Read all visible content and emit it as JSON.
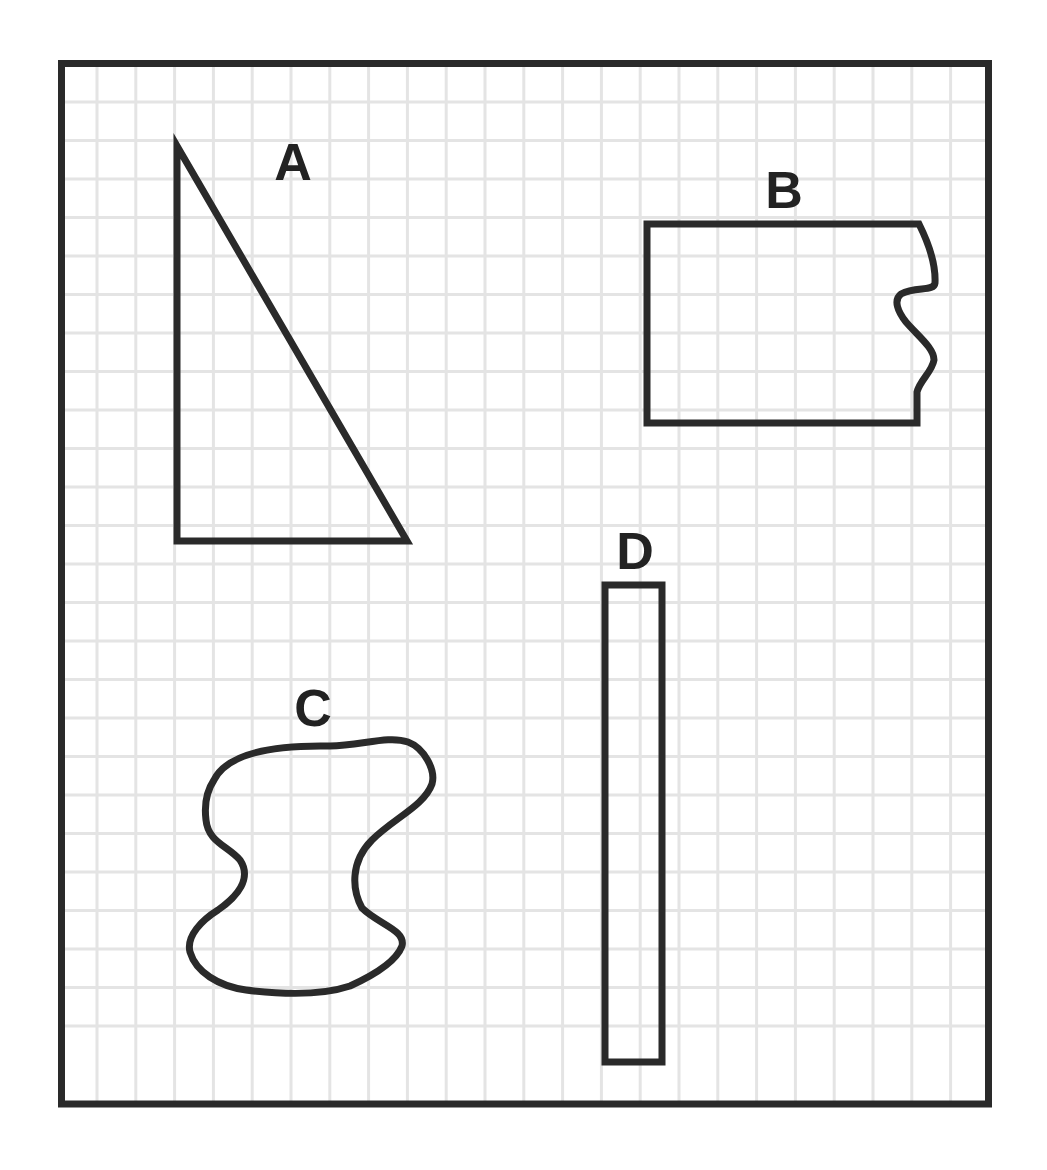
{
  "diagram": {
    "title": "",
    "frame": {
      "x": 61.5,
      "y": 63.5,
      "width": 927,
      "height": 1040.5,
      "stroke": "#2a2a2a",
      "stroke_width": 7
    },
    "grid": {
      "color": "#e4e4e4",
      "line_width": 3,
      "vertical_start": 97,
      "vertical_step": 38.8,
      "vertical_count": 23,
      "horizontal_start": 102,
      "horizontal_step": 38.5,
      "horizontal_count": 25
    },
    "shape_stroke": "#2a2a2a",
    "shape_stroke_width": 7,
    "shapes": [
      {
        "id": "A",
        "label": "A",
        "type": "right-triangle",
        "label_pos": [
          293,
          180
        ],
        "path": "M177,146 L177,541 L407,541 Z"
      },
      {
        "id": "B",
        "label": "B",
        "type": "rectangle-with-torn-edge",
        "label_pos": [
          784,
          208
        ],
        "path": "M647,224 L919,224 C928,242 936,262 935,283 C934,292 916,286 901,294 C893,300 898,312 906,322 C918,336 934,348 934,360 C932,372 920,380 917,392 L917,423 L647,423 Z"
      },
      {
        "id": "C",
        "label": "C",
        "type": "irregular-blob",
        "label_pos": [
          313,
          726
        ],
        "path": "M214,780 C228,752 278,745 330,746 C360,746 388,735 408,742 C424,748 436,770 432,784 C424,806 394,818 372,840 C350,862 352,890 362,908 C378,924 406,930 402,946 C396,962 372,976 350,986 C320,996 278,994 246,990 C218,986 196,972 190,952 C186,936 202,920 218,910 C238,896 252,878 240,860 C228,846 208,842 206,820 C204,804 206,792 214,780 Z"
      },
      {
        "id": "D",
        "label": "D",
        "type": "tall-narrow-rectangle",
        "label_pos": [
          635,
          569
        ],
        "path": "M605,585 L662,585 L662,1062 L605,1062 Z"
      }
    ]
  }
}
